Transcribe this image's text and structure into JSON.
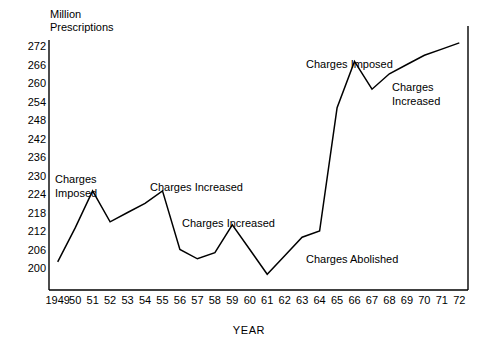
{
  "chart_data": {
    "type": "line",
    "title": "",
    "ylabel": "Million\nPrescriptions",
    "xlabel": "YEAR",
    "ylim": [
      197,
      275
    ],
    "yticks": [
      200,
      206,
      212,
      218,
      224,
      230,
      236,
      242,
      248,
      254,
      260,
      266,
      272
    ],
    "xticklabels": [
      "1949",
      "50",
      "51",
      "52",
      "53",
      "54",
      "55",
      "56",
      "57",
      "58",
      "59",
      "60",
      "61",
      "62",
      "63",
      "64",
      "65",
      "66",
      "67",
      "68",
      "69",
      "70",
      "71",
      "72"
    ],
    "x": [
      1949,
      1950,
      1951,
      1952,
      1953,
      1954,
      1955,
      1956,
      1957,
      1958,
      1959,
      1960,
      1961,
      1962,
      1963,
      1964,
      1965,
      1966,
      1967,
      1968,
      1969,
      1970,
      1971,
      1972
    ],
    "values": [
      202,
      213,
      225,
      215,
      218,
      221,
      225,
      206,
      203,
      205,
      214,
      206,
      198,
      204,
      210,
      212,
      252,
      267,
      258,
      263,
      266,
      269,
      271,
      273
    ],
    "grid": false,
    "legend": null,
    "line_color": "#000000",
    "annotations": [
      {
        "text": "Charges\nImposed",
        "x": 1950,
        "y": 236
      },
      {
        "text": "Charges Increased",
        "x": 1955,
        "y": 231
      },
      {
        "text": "Charges Increased",
        "x": 1959,
        "y": 222
      },
      {
        "text": "Charges Abolished",
        "x": 1965,
        "y": 209
      },
      {
        "text": "Charges Imposed",
        "x": 1967,
        "y": 270
      },
      {
        "text": "Charges\nIncreased",
        "x": 1970,
        "y": 264
      }
    ]
  },
  "annotation_labels": {
    "charges_imposed_1950_line1": "Charges",
    "charges_imposed_1950_line2": "Imposed",
    "charges_increased_1955": "Charges Increased",
    "charges_increased_1959": "Charges Increased",
    "charges_abolished_1964": "Charges Abolished",
    "charges_imposed_1966": "Charges Imposed",
    "charges_increased_1969_line1": "Charges",
    "charges_increased_1969_line2": "Increased"
  },
  "axis_titles": {
    "y_line1": "Million",
    "y_line2": "Prescriptions",
    "x": "YEAR"
  }
}
